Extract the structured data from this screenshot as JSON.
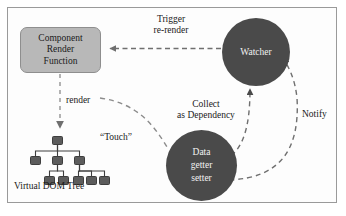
{
  "diagram": {
    "colors": {
      "frame_border": "#9a9a9a",
      "box_fill": "#b8b8b8",
      "box_border": "#8e8e8e",
      "circle_fill": "#4a4a4a",
      "circle_text": "#f2f2f2",
      "tree_node_fill": "#5c5c5c",
      "tree_node_border": "#3e3e3e",
      "arrow_stroke": "#6f6f6f",
      "text": "#1a1a1a",
      "background": "#ffffff"
    },
    "nodes": {
      "component_box": {
        "name": "Component Render Function",
        "lines": [
          "Component",
          "Render",
          "Function"
        ],
        "shape": "rounded-rectangle"
      },
      "watcher_circle": {
        "name": "Watcher",
        "lines": [
          "Watcher"
        ],
        "shape": "circle"
      },
      "data_circle": {
        "name": "Data getter setter",
        "lines": [
          "Data",
          "getter",
          "setter"
        ],
        "shape": "circle"
      },
      "virtual_dom_tree": {
        "caption": "Virtual DOM Tree",
        "shape": "tree"
      }
    },
    "edges": [
      {
        "id": "trigger-re-render",
        "label_lines": [
          "Trigger",
          "re-render"
        ],
        "from": "watcher_circle",
        "to": "component_box",
        "style": "dashed",
        "arrow": "left"
      },
      {
        "id": "render",
        "label_lines": [
          "render"
        ],
        "from": "component_box",
        "to": "virtual_dom_tree",
        "style": "dashed",
        "arrow": "down"
      },
      {
        "id": "touch",
        "label_lines": [
          "“Touch”"
        ],
        "from": "virtual_dom_tree",
        "to": "data_circle",
        "style": "dashed",
        "arrow": "none"
      },
      {
        "id": "collect-as-dependency",
        "label_lines": [
          "Collect",
          "as Dependency"
        ],
        "from": "data_circle",
        "to": "watcher_circle",
        "style": "dashed",
        "arrow": "up"
      },
      {
        "id": "notify",
        "label_lines": [
          "Notify"
        ],
        "from": "data_circle",
        "to": "watcher_circle",
        "style": "dashed",
        "arrow": "up"
      }
    ],
    "labels": {
      "trigger_line1": "Trigger",
      "trigger_line2": "re-render",
      "render": "render",
      "touch": "“Touch”",
      "collect_line1": "Collect",
      "collect_line2": "as Dependency",
      "notify": "Notify",
      "component_line1": "Component",
      "component_line2": "Render",
      "component_line3": "Function",
      "watcher": "Watcher",
      "data_line1": "Data",
      "data_line2": "getter",
      "data_line3": "setter",
      "vdom_caption": "Virtual DOM Tree"
    },
    "tree": {
      "nodes": [
        {
          "x": 36,
          "y": 0,
          "w": 11,
          "h": 9
        },
        {
          "x": 14,
          "y": 20,
          "w": 11,
          "h": 9
        },
        {
          "x": 36,
          "y": 20,
          "w": 11,
          "h": 9
        },
        {
          "x": 58,
          "y": 20,
          "w": 11,
          "h": 9
        },
        {
          "x": 28,
          "y": 40,
          "w": 11,
          "h": 9
        },
        {
          "x": 42,
          "y": 40,
          "w": 11,
          "h": 9
        },
        {
          "x": 57,
          "y": 40,
          "w": 11,
          "h": 9
        },
        {
          "x": 70,
          "y": 40,
          "w": 11,
          "h": 9
        },
        {
          "x": 83,
          "y": 40,
          "w": 11,
          "h": 9
        }
      ],
      "links": [
        {
          "from": 0,
          "to": 1
        },
        {
          "from": 0,
          "to": 2
        },
        {
          "from": 0,
          "to": 3
        },
        {
          "from": 2,
          "to": 4
        },
        {
          "from": 2,
          "to": 5
        },
        {
          "from": 3,
          "to": 6
        },
        {
          "from": 3,
          "to": 7
        },
        {
          "from": 3,
          "to": 8
        }
      ]
    }
  }
}
